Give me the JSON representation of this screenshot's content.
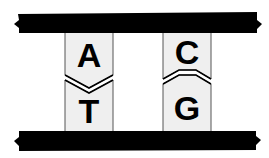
{
  "figure": {
    "background_color": "#ffffff",
    "width": 269,
    "height": 158
  },
  "strands": {
    "top": {
      "name": "top-backbone-bar",
      "color": "#000000",
      "x": 17,
      "y": 13,
      "width": 241,
      "height": 20,
      "end_style": "notched-ribbon"
    },
    "bottom": {
      "name": "bottom-backbone-bar",
      "color": "#000000",
      "x": 17,
      "y": 131,
      "width": 241,
      "height": 20,
      "end_style": "notched-ribbon"
    }
  },
  "base_pairs": [
    {
      "id": "pair-at",
      "upper_base": "A",
      "lower_base": "T",
      "column_x": 65,
      "column_width": 48,
      "fill_color": "#efefef",
      "outline_color": "#555555",
      "split_style": "chevron-down",
      "split_y": 78
    },
    {
      "id": "pair-cg",
      "upper_base": "C",
      "lower_base": "G",
      "column_x": 163,
      "column_width": 48,
      "fill_color": "#efefef",
      "outline_color": "#555555",
      "split_style": "trapezoid-up",
      "split_y": 78
    }
  ],
  "colors": {
    "ink": "#000000",
    "panel_fill": "#efefef",
    "panel_edge": "#555555",
    "paper": "#ffffff"
  }
}
